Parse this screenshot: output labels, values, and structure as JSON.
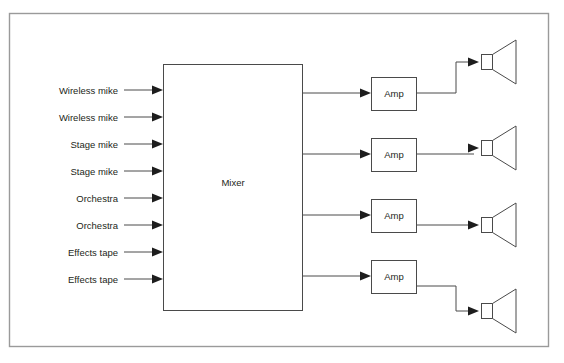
{
  "diagram": {
    "frame": {
      "x": 9,
      "y": 13,
      "width": 540,
      "height": 334,
      "color": "#9a9a9a"
    },
    "line_color": "#4a4a4a",
    "text_color": "#231f20",
    "background": "#ffffff",
    "inputs": [
      {
        "label": "Wireless mike",
        "y": 90
      },
      {
        "label": "Wireless mike",
        "y": 117
      },
      {
        "label": "Stage mike",
        "y": 144
      },
      {
        "label": "Stage mike",
        "y": 171
      },
      {
        "label": "Orchestra",
        "y": 198
      },
      {
        "label": "Orchestra",
        "y": 225
      },
      {
        "label": "Effects tape",
        "y": 252
      },
      {
        "label": "Effects tape",
        "y": 279
      }
    ],
    "mixer": {
      "label": "Mixer",
      "x": 163,
      "y": 64,
      "width": 139,
      "height": 246,
      "label_x": 233,
      "label_y": 186
    },
    "amps": [
      {
        "label": "Amp",
        "x": 371,
        "y": 77,
        "width": 45,
        "height": 33,
        "in_y": 93,
        "out_y": 93
      },
      {
        "label": "Amp",
        "x": 371,
        "y": 138,
        "width": 45,
        "height": 33,
        "in_y": 154,
        "out_y": 154
      },
      {
        "label": "Amp",
        "x": 371,
        "y": 199,
        "width": 45,
        "height": 33,
        "in_y": 215,
        "out_y": 225
      },
      {
        "label": "Amp",
        "x": 371,
        "y": 260,
        "width": 45,
        "height": 33,
        "in_y": 276,
        "out_y": 276
      }
    ],
    "speakers": [
      {
        "name": "speaker-1",
        "in_y": 62,
        "cx": 487
      },
      {
        "name": "speaker-2",
        "in_y": 148,
        "cx": 487
      },
      {
        "name": "speaker-3",
        "in_y": 225,
        "cx": 487
      },
      {
        "name": "speaker-4",
        "in_y": 311,
        "cx": 487
      }
    ],
    "mixer_outputs": [
      {
        "y": 93
      },
      {
        "y": 154
      },
      {
        "y": 215
      },
      {
        "y": 276
      }
    ],
    "icons": {
      "speaker": "speaker-horn-icon",
      "arrow": "arrow-right-icon"
    }
  }
}
